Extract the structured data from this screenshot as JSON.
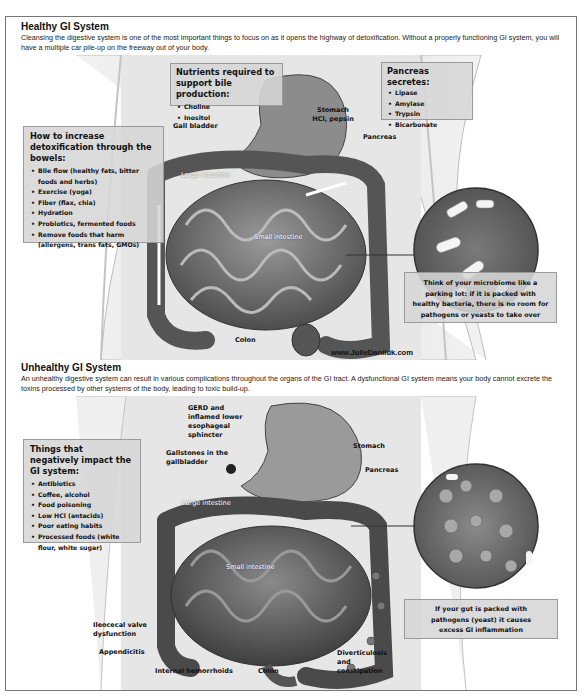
{
  "healthy": {
    "title": "Healthy GI System",
    "description": "Cleansing the digestive system is one of the most important things to focus on as it opens the highway of detoxification. Without a properly functioning GI system, you will have a multiple car pile-up on the freeway out of your body.",
    "callouts": {
      "nutrients": {
        "heading": "Nutrients required to support bile production:",
        "items": [
          "Choline",
          "Inositol"
        ]
      },
      "pancreas": {
        "heading": "Pancreas secretes:",
        "items": [
          "Lipase",
          "Amylase",
          "Trypsin",
          "Bicarbonate"
        ]
      },
      "detox": {
        "heading": "How to increase detoxification through the bowels:",
        "items": [
          "Bile flow (healthy fats, bitter foods and herbs)",
          "Exercise (yoga)",
          "Fiber (flax, chia)",
          "Hydration",
          "Probiotics, fermented foods",
          "Remove foods that harm (allergens, trans fats, GMOs)"
        ]
      },
      "microbiome": "Think of your microbiome like a parking lot: if it is packed with healthy bacteria, there is no room for pathogens or yeasts to take over"
    },
    "labels": {
      "gall_bladder": "Gall bladder",
      "stomach": "Stomach",
      "stomach_sub": "HCl, pepsin",
      "pancreas": "Pancreas",
      "large_intestine": "Large intestine",
      "small_intestine": "Small intestine",
      "colon": "Colon"
    },
    "website": "www.JulieDaniluk.com"
  },
  "unhealthy": {
    "title": "Unhealthy GI System",
    "description": "An unhealthy digestive system can result in various complications throughout the organs of the GI tract. A dysfunctional GI system means your body cannot excrete the toxins processed by other systems of the body, leading to toxic build-up.",
    "callouts": {
      "negative": {
        "heading": "Things that negatively impact the GI system:",
        "items": [
          "Antibiotics",
          "Coffee, alcohol",
          "Food poisoning",
          "Low HCl (antacids)",
          "Poor eating habits",
          "Processed foods (white flour, white sugar)"
        ]
      },
      "pathogens": "If your gut is packed with pathogens (yeast) it causes excess GI inflammation"
    },
    "labels": {
      "gerd": "GERD and inflamed lower esophageal sphincter",
      "gallstones": "Gallstones in the gallbladder",
      "stomach": "Stomach",
      "pancreas": "Pancreas",
      "large_intestine": "Large intestine",
      "small_intestine": "Small intestine",
      "ileocecal": "Ileocecal valve dysfunction",
      "appendicitis": "Appendicitis",
      "hemorrhoids": "Internal hemorrhoids",
      "colon": "Colon",
      "diverticulosis": "Diverticulosis and constipation"
    }
  }
}
